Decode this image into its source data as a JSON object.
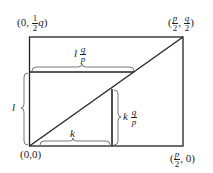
{
  "diagram": {
    "type": "geometric-lattice-rectangle",
    "rectangle": {
      "x0": 29,
      "y0": 37,
      "x1": 183,
      "y1": 146
    },
    "lines": {
      "diagonal": {
        "from": [
          29,
          146
        ],
        "to": [
          183,
          37
        ]
      },
      "horizontal_inner": {
        "from": [
          29,
          72
        ],
        "to": [
          134,
          72
        ]
      },
      "vertical_inner": {
        "from": [
          112,
          89
        ],
        "to": [
          112,
          146
        ]
      }
    },
    "stroke_color": "#222222"
  },
  "labels": {
    "top_left": {
      "prefix": "(0, ",
      "frac_num": "1",
      "frac_den": "2",
      "suffix_var": "q",
      "close": ")"
    },
    "top_right": {
      "open": "(",
      "frac1_num": "p",
      "frac1_den": "2",
      "sep": ", ",
      "frac2_num": "q",
      "frac2_den": "2",
      "close": ")"
    },
    "origin": "(0,0)",
    "bottom_right": {
      "open": "(",
      "frac_num": "p",
      "frac_den": "2",
      "rest": ", 0)"
    },
    "brace_top": {
      "var": "l",
      "frac_num": "q",
      "frac_den": "p"
    },
    "brace_left": "l",
    "brace_bottom": "k",
    "brace_right": {
      "var": "k",
      "frac_num": "q",
      "frac_den": "p"
    }
  }
}
